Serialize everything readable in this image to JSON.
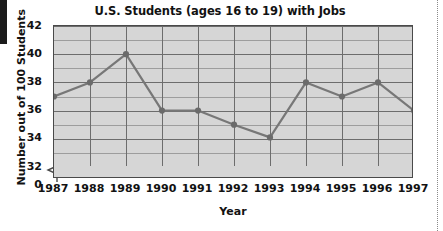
{
  "chart_data": {
    "type": "line",
    "title": "U.S. Students (ages 16 to 19) with Jobs",
    "xlabel": "Year",
    "ylabel": "Number out of 100 Students",
    "categories": [
      "1987",
      "1988",
      "1989",
      "1990",
      "1991",
      "1992",
      "1993",
      "1994",
      "1995",
      "1996",
      "1997"
    ],
    "values": [
      37,
      38,
      40,
      36,
      36,
      35,
      34.1,
      38,
      37,
      38,
      36
    ],
    "series": [
      {
        "name": "Number out of 100 Students",
        "values": [
          37,
          38,
          40,
          36,
          36,
          35,
          34.1,
          38,
          37,
          38,
          36
        ]
      }
    ],
    "ylim": [
      32,
      42
    ],
    "y_axis_break_label": "0",
    "y_ticks": [
      "42",
      "40",
      "38",
      "36",
      "34",
      "32",
      "0"
    ],
    "y_tick_values": [
      42,
      40,
      38,
      36,
      34,
      32
    ],
    "y_major_step": 2,
    "y_minor_step": 1,
    "grid": true,
    "grid_vertical": true,
    "legend": "none",
    "marker": "circle",
    "colors": {
      "line": "#777777",
      "marker": "#6b6b6b",
      "plot_background": "#d6d6d6",
      "gridline_major": "#6d6d6d",
      "gridline_minor": "#9d9d9d",
      "axis": "#4a4a4a",
      "text": "#121212"
    }
  }
}
